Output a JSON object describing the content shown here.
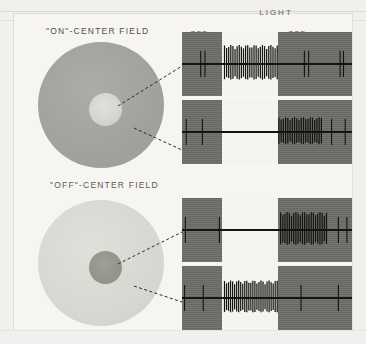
{
  "figure": {
    "title_light": "LIGHT",
    "phase_on": "ON",
    "phase_off_left": "OFF",
    "phase_off_right": "OFF",
    "field_on_title": "\"ON\"-CENTER FIELD",
    "field_off_title": "\"OFF\"-CENTER FIELD",
    "colors": {
      "background": "#f1f0ec",
      "paper": "#f6f5f1",
      "dark_panel": "#6e6d67",
      "light_panel": "#f4f3ef",
      "trace_ink": "#15140f",
      "surround_dark": "#a3a29c",
      "center_light": "#d2d1cb",
      "surround_light": "#d8d7d1",
      "center_dark": "#949389",
      "leader_line": "#2b2a26"
    }
  },
  "chart_data": {
    "type": "line",
    "xlabel": "Time (light stimulus phases)",
    "ylabel": "Extracellular spike activity",
    "grid": false,
    "legend_position": "none",
    "x_phases": [
      {
        "name": "OFF",
        "label": "OFF",
        "shaded": true,
        "start_pct": 0,
        "end_pct": 23.5
      },
      {
        "name": "ON",
        "label": "ON",
        "shaded": false,
        "start_pct": 23.5,
        "end_pct": 56.5
      },
      {
        "name": "OFF",
        "label": "OFF",
        "shaded": true,
        "start_pct": 56.5,
        "end_pct": 100
      }
    ],
    "fields": [
      {
        "name": "\"ON\"-CENTER FIELD",
        "surround_tone": "dark",
        "center_tone": "light",
        "center_radius_pct": 26,
        "traces": [
          "on-center-center-spot",
          "on-center-surround-annulus"
        ]
      },
      {
        "name": "\"OFF\"-CENTER FIELD",
        "surround_tone": "light",
        "center_tone": "dark",
        "center_radius_pct": 26,
        "traces": [
          "off-center-center-spot",
          "off-center-surround-annulus"
        ]
      }
    ],
    "series": [
      {
        "name": "ON-centre cell, spot on field centre",
        "field": "\"ON\"-CENTER FIELD",
        "stimulus_region": "centre",
        "response_type": "ON response",
        "burst_phase": "ON",
        "baseline_spike_positions_pct": [
          11,
          13.5,
          72,
          74.5,
          93,
          95
        ],
        "burst_start_pct": 25,
        "burst_end_pct": 56,
        "burst_spike_count": 26,
        "burst_amplitude": 1.0
      },
      {
        "name": "ON-centre cell, annulus on surround",
        "field": "\"ON\"-CENTER FIELD",
        "stimulus_region": "surround",
        "response_type": "OFF response",
        "burst_phase": "OFF (second)",
        "baseline_spike_positions_pct": [
          2.5,
          12,
          88,
          96
        ],
        "burst_start_pct": 57,
        "burst_end_pct": 82,
        "burst_spike_count": 20,
        "burst_amplitude": 0.78
      },
      {
        "name": "OFF-centre cell, spot on field centre",
        "field": "\"OFF\"-CENTER FIELD",
        "stimulus_region": "centre",
        "response_type": "OFF response",
        "burst_phase": "OFF (second)",
        "baseline_spike_positions_pct": [
          2,
          22,
          92,
          97
        ],
        "burst_start_pct": 58,
        "burst_end_pct": 85,
        "burst_spike_count": 22,
        "burst_amplitude": 0.95
      },
      {
        "name": "OFF-centre cell, annulus on surround",
        "field": "\"OFF\"-CENTER FIELD",
        "stimulus_region": "surround",
        "response_type": "ON response",
        "burst_phase": "ON",
        "baseline_spike_positions_pct": [
          1.5,
          12.5,
          70,
          92
        ],
        "burst_start_pct": 25,
        "burst_end_pct": 56,
        "burst_spike_count": 27,
        "burst_amplitude": 0.92
      }
    ]
  }
}
